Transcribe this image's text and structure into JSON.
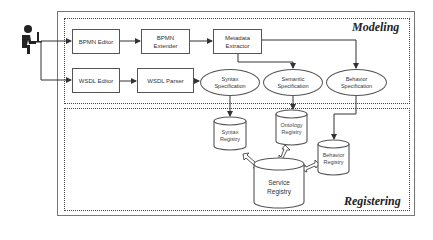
{
  "diagram": {
    "regions": {
      "modeling": {
        "label": "Modeling"
      },
      "registering": {
        "label": "Registering"
      }
    },
    "actor": {
      "name": "user-at-computer"
    },
    "modeling_nodes": {
      "bpmn_editor": {
        "label": "BPMN Editor"
      },
      "bpmn_extender": {
        "line1": "BPMN",
        "line2": "Extender"
      },
      "metadata_extractor": {
        "line1": "Metadata",
        "line2": "Extractor"
      },
      "wsdl_editor": {
        "label": "WSDL Editor"
      },
      "wsdl_parser": {
        "label": "WSDL Parser"
      },
      "syntax_spec": {
        "line1": "Syntax",
        "line2": "Specification"
      },
      "semantic_spec": {
        "line1": "Semantic",
        "line2": "Specification"
      },
      "behavior_spec": {
        "line1": "Behavior",
        "line2": "Specification"
      }
    },
    "registering_nodes": {
      "syntax_registry": {
        "line1": "Syntax",
        "line2": "Registry"
      },
      "ontology_registry": {
        "line1": "Ontology",
        "line2": "Registry"
      },
      "behavior_registry": {
        "line1": "Behavior",
        "line2": "Registry"
      },
      "service_registry": {
        "line1": "Service",
        "line2": "Registry"
      }
    },
    "edges": [
      {
        "from": "actor",
        "to": "BPMN Editor"
      },
      {
        "from": "actor",
        "to": "WSDL Editor"
      },
      {
        "from": "BPMN Editor",
        "to": "BPMN Extender"
      },
      {
        "from": "BPMN Extender",
        "to": "Metadata Extractor"
      },
      {
        "from": "Metadata Extractor",
        "to": "Semantic Specification"
      },
      {
        "from": "Metadata Extractor",
        "to": "Behavior Specification"
      },
      {
        "from": "WSDL Editor",
        "to": "WSDL Parser"
      },
      {
        "from": "WSDL Parser",
        "to": "Syntax Specification"
      },
      {
        "from": "Syntax Specification",
        "to": "Syntax Registry"
      },
      {
        "from": "Semantic Specification",
        "to": "Ontology Registry"
      },
      {
        "from": "Behavior Specification",
        "to": "Behavior Registry"
      },
      {
        "from": "Syntax Registry",
        "to": "Service Registry",
        "type": "bidirectional"
      },
      {
        "from": "Ontology Registry",
        "to": "Service Registry",
        "type": "bidirectional"
      },
      {
        "from": "Behavior Registry",
        "to": "Service Registry",
        "type": "bidirectional"
      }
    ]
  }
}
